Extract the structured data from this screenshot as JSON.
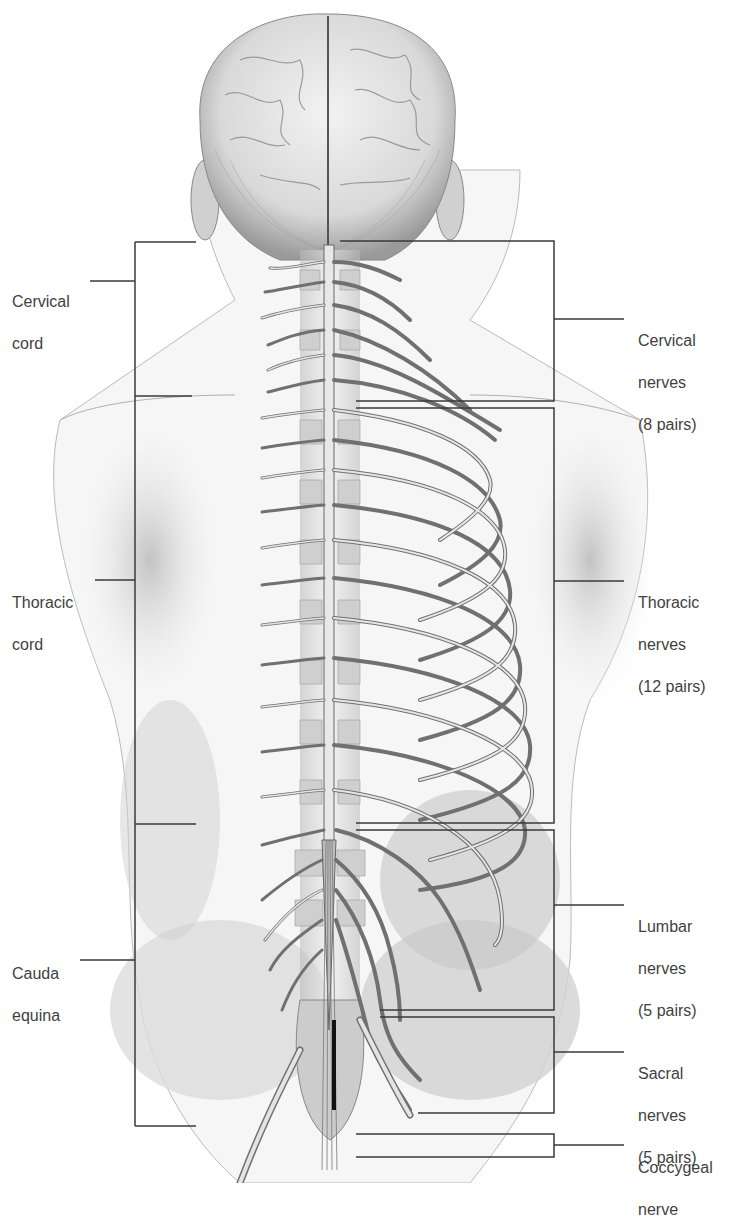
{
  "figure": {
    "title": "",
    "colors": {
      "line": "#3a3a3a",
      "nerve_fill": "#d8d8d8",
      "nerve_edge": "#6e6e6e",
      "skin_shade": "#c8c8c8",
      "text": "#3f3f3f"
    }
  },
  "left_labels": [
    {
      "id": "cervical-cord",
      "lines": [
        "Cervical",
        "cord"
      ],
      "x": 12,
      "y": 269
    },
    {
      "id": "thoracic-cord",
      "lines": [
        "Thoracic",
        "cord"
      ],
      "x": 12,
      "y": 571
    },
    {
      "id": "cauda-equina",
      "lines": [
        "Cauda",
        "equina"
      ],
      "x": 12,
      "y": 942
    }
  ],
  "right_labels": [
    {
      "id": "cervical-nerves",
      "lines": [
        "Cervical",
        "nerves",
        "(8 pairs)"
      ],
      "x": 638,
      "y": 309
    },
    {
      "id": "thoracic-nerves",
      "lines": [
        "Thoracic",
        "nerves",
        "(12 pairs)"
      ],
      "x": 638,
      "y": 571
    },
    {
      "id": "lumbar-nerves",
      "lines": [
        "Lumbar",
        "nerves",
        "(5 pairs)"
      ],
      "x": 638,
      "y": 895
    },
    {
      "id": "sacral-nerves",
      "lines": [
        "Sacral",
        "nerves",
        "(5 pairs)"
      ],
      "x": 638,
      "y": 1042
    },
    {
      "id": "coccygeal-nerve",
      "lines": [
        "Coccygeal",
        "nerve"
      ],
      "x": 638,
      "y": 1138
    }
  ]
}
